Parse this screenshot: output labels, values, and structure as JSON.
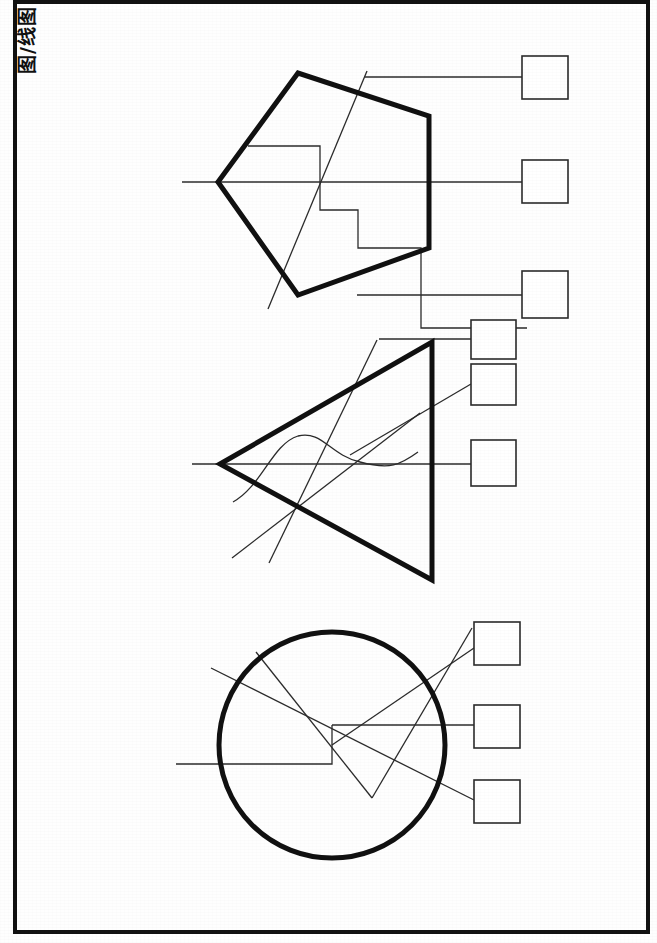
{
  "document": {
    "title": "Line drawing sheet with three callout diagrams",
    "sheet_background": "#fefefe",
    "ink_color": "#111111",
    "thin_ink_color": "#2b2b2b"
  },
  "margin_frame": {
    "name": "sheet-border",
    "left": 15,
    "top": 2,
    "right": 648,
    "bottom": 932,
    "stroke_width": 4,
    "color": "#111111"
  },
  "rotated_caption": {
    "text": "图/线图",
    "rotation_deg": -90,
    "cropped": true,
    "position": "top-left-edge"
  },
  "groups": [
    {
      "id": "pentagon-group",
      "label": "pentagon-diagram",
      "shape": {
        "type": "pentagon",
        "stroke_width": 5,
        "points": "218,182 298,73 429,116 429,248 298,295"
      },
      "callout_boxes": [
        {
          "id": "box-1",
          "x": 522,
          "y": 56,
          "w": 46,
          "h": 43
        },
        {
          "id": "box-2",
          "x": 522,
          "y": 160,
          "w": 46,
          "h": 43
        },
        {
          "id": "box-3",
          "x": 522,
          "y": 271,
          "w": 46,
          "h": 47
        }
      ],
      "leader_lines": [
        {
          "id": "leader-1",
          "type": "polyline",
          "points": "365,77 522,77"
        },
        {
          "id": "leader-2",
          "type": "polyline",
          "points": "182,182 522,182"
        },
        {
          "id": "leader-3",
          "type": "polyline",
          "points": "357,295 522,295"
        }
      ],
      "annotation_paths": [
        {
          "id": "step-path",
          "type": "polyline",
          "points": "248,146 320,146 320,210 358,210 358,248 421,248 421,328 527,328"
        },
        {
          "id": "diagonal-slash",
          "type": "line",
          "points": "367,71 268,309"
        }
      ]
    },
    {
      "id": "triangle-group",
      "label": "triangle-diagram",
      "shape": {
        "type": "triangle",
        "stroke_width": 5,
        "points": "220,464 432,342 432,580"
      },
      "callout_boxes": [
        {
          "id": "box-4",
          "x": 471,
          "y": 320,
          "w": 45,
          "h": 39
        },
        {
          "id": "box-5",
          "x": 471,
          "y": 364,
          "w": 45,
          "h": 41
        },
        {
          "id": "box-6",
          "x": 471,
          "y": 440,
          "w": 45,
          "h": 46
        }
      ],
      "leader_lines": [
        {
          "id": "leader-4",
          "type": "polyline",
          "points": "379,339 471,339"
        },
        {
          "id": "leader-5",
          "type": "line",
          "points": "471,384 350,455"
        },
        {
          "id": "leader-6",
          "type": "line",
          "points": "192,464 471,464"
        }
      ],
      "annotation_paths": [
        {
          "id": "wave-curve",
          "type": "path",
          "d": "M 233,502 C 262,486 272,444 298,436 C 322,430 330,455 360,462 C 390,470 400,465 418,452"
        },
        {
          "id": "steep-line",
          "type": "line",
          "points": "377,340 269,563"
        },
        {
          "id": "long-diagonal",
          "type": "line",
          "points": "420,413 232,558"
        }
      ]
    },
    {
      "id": "circle-group",
      "label": "circle-diagram",
      "shape": {
        "type": "circle",
        "stroke_width": 5,
        "cx": 332,
        "cy": 745,
        "r": 113
      },
      "callout_boxes": [
        {
          "id": "box-7",
          "x": 474,
          "y": 622,
          "w": 46,
          "h": 43
        },
        {
          "id": "box-8",
          "x": 474,
          "y": 705,
          "w": 46,
          "h": 43
        },
        {
          "id": "box-9",
          "x": 474,
          "y": 780,
          "w": 46,
          "h": 43
        }
      ],
      "leader_lines": [
        {
          "id": "leader-7",
          "type": "line",
          "points": "474,648 332,745"
        },
        {
          "id": "leader-8",
          "type": "polyline",
          "points": "332,725 474,725"
        },
        {
          "id": "leader-9",
          "type": "line",
          "points": "474,800 211,668"
        }
      ],
      "annotation_paths": [
        {
          "id": "circle-step-path",
          "type": "polyline",
          "points": "332,725 332,764 176,764"
        },
        {
          "id": "v-line-left",
          "type": "line",
          "points": "256,652 372,798"
        },
        {
          "id": "v-line-right",
          "type": "line",
          "points": "372,798 472,628"
        }
      ]
    }
  ],
  "legend": {
    "thick_stroke": 5,
    "thin_stroke": 1.3,
    "box_stroke": 1.6,
    "box_fill": "none"
  }
}
